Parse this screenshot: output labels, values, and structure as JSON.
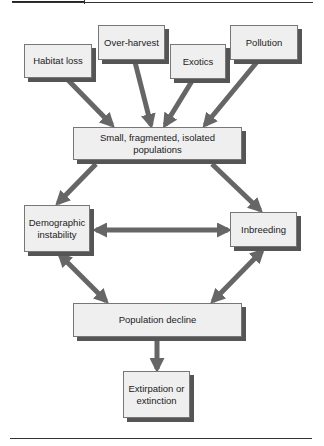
{
  "diagram": {
    "colors": {
      "box_fill": "#efefef",
      "box_border": "#777777",
      "box_shadow": "#555555",
      "arrow": "#666666",
      "text": "#222222"
    },
    "nodes": {
      "habitat_loss": "Habitat loss",
      "over_harvest": "Over-harvest",
      "exotics": "Exotics",
      "pollution": "Pollution",
      "small_populations": "Small, fragmented, isolated populations",
      "demographic_instability": "Demographic instability",
      "inbreeding": "Inbreeding",
      "population_decline": "Population decline",
      "extirpation": "Extirpation or extinction"
    },
    "edges": [
      {
        "from": "Habitat loss",
        "to": "Small, fragmented, isolated populations",
        "bidirectional": false
      },
      {
        "from": "Over-harvest",
        "to": "Small, fragmented, isolated populations",
        "bidirectional": false
      },
      {
        "from": "Exotics",
        "to": "Small, fragmented, isolated populations",
        "bidirectional": false
      },
      {
        "from": "Pollution",
        "to": "Small, fragmented, isolated populations",
        "bidirectional": false
      },
      {
        "from": "Small, fragmented, isolated populations",
        "to": "Demographic instability",
        "bidirectional": false
      },
      {
        "from": "Small, fragmented, isolated populations",
        "to": "Inbreeding",
        "bidirectional": false
      },
      {
        "from": "Demographic instability",
        "to": "Inbreeding",
        "bidirectional": true
      },
      {
        "from": "Demographic instability",
        "to": "Population decline",
        "bidirectional": true
      },
      {
        "from": "Inbreeding",
        "to": "Population decline",
        "bidirectional": true
      },
      {
        "from": "Population decline",
        "to": "Extirpation or extinction",
        "bidirectional": false
      }
    ]
  }
}
